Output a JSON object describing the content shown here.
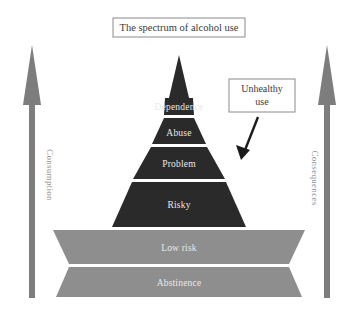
{
  "title": {
    "text": "The spectrum of alcohol use"
  },
  "callout": {
    "line1": "Unhealthy",
    "line2": "use"
  },
  "axes": {
    "left": {
      "label": "Consumption",
      "direction": "up"
    },
    "right": {
      "label": "Consequences",
      "direction": "up"
    }
  },
  "pyramid": {
    "bands": [
      {
        "label": "Dependence",
        "tone": "dark"
      },
      {
        "label": "Abuse",
        "tone": "dark"
      },
      {
        "label": "Problem",
        "tone": "dark"
      },
      {
        "label": "Risky",
        "tone": "dark"
      },
      {
        "label": "Low risk",
        "tone": "light"
      },
      {
        "label": "Abstinence",
        "tone": "light"
      }
    ]
  },
  "colors": {
    "dark_band": "#2b2a2a",
    "light_band": "#8e8e8e",
    "divider": "#f2f2f2",
    "arrow": "#7d7d7d",
    "pointer_arrow": "#1a1a1a",
    "box_border": "#8a8a8a",
    "text_dark": "#3a3a3a",
    "text_light": "#e9e9e9",
    "side_text": "#8f8f8f",
    "background": "#ffffff"
  }
}
